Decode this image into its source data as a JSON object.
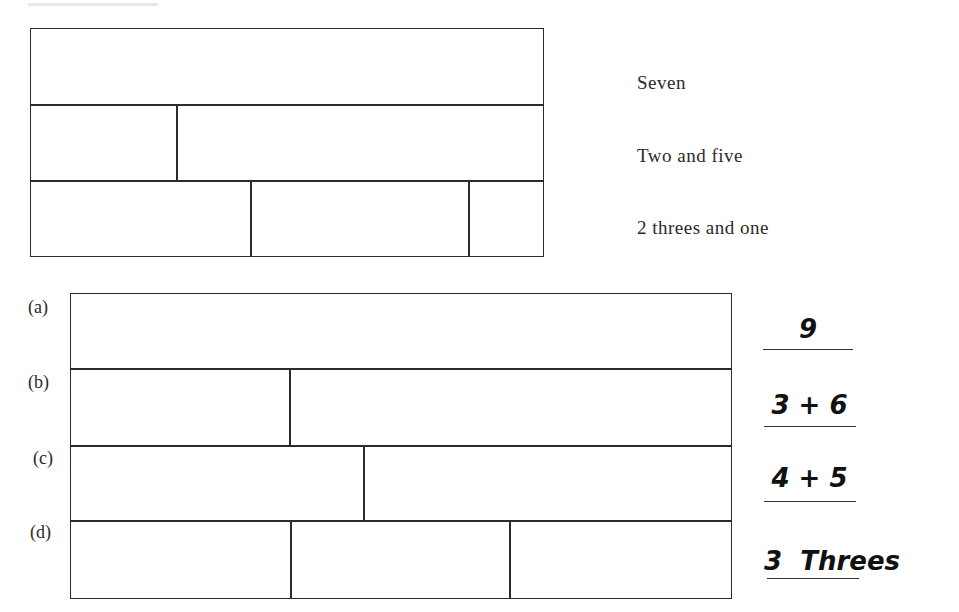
{
  "example": {
    "rows": [
      {
        "label": "Seven",
        "parts": [
          7
        ]
      },
      {
        "label": "Two and five",
        "parts": [
          2,
          5
        ]
      },
      {
        "label": "2 threes and one",
        "parts": [
          3,
          3,
          1
        ]
      }
    ]
  },
  "exercise": {
    "rows": [
      {
        "marker": "(a)",
        "answer": "9",
        "parts": [
          9
        ]
      },
      {
        "marker": "(b)",
        "answer": "3 + 6",
        "parts": [
          3,
          6
        ]
      },
      {
        "marker": "(c)",
        "answer": "4 + 5",
        "parts": [
          4,
          5
        ]
      },
      {
        "marker": "(d)",
        "answer": "3  Threes",
        "parts": [
          3,
          3,
          3
        ]
      }
    ]
  }
}
